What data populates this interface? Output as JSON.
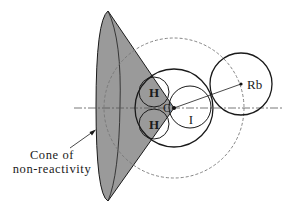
{
  "diagram": {
    "labels": {
      "h_upper": "H",
      "h_lower": "H",
      "carbon": "C",
      "iodine": "I",
      "rubidium": "Rb",
      "cone_line1": "Cone of",
      "cone_line2": "non-reactivity"
    },
    "colors": {
      "cone_fill": "#9a9a9a",
      "stroke": "#1a1a1a",
      "dashed": "#777777",
      "background": "#ffffff"
    },
    "elements": [
      {
        "id": "cone",
        "label": "Cone of non-reactivity",
        "apex": [
          174,
          108
        ]
      },
      {
        "id": "reaction-sphere",
        "style": "dashed",
        "center": [
          174,
          108
        ],
        "r": 70
      },
      {
        "id": "molecule-envelope",
        "center": [
          174,
          108
        ],
        "r": 39
      },
      {
        "id": "atom-H-upper",
        "center": [
          154,
          92
        ],
        "r": 15
      },
      {
        "id": "atom-H-lower",
        "center": [
          154,
          124
        ],
        "r": 15
      },
      {
        "id": "atom-I",
        "center": [
          190,
          107
        ],
        "r": 21
      },
      {
        "id": "atom-Rb",
        "center": [
          240,
          84
        ],
        "r": 31
      },
      {
        "id": "axis",
        "style": "dash-dot",
        "y": 108
      },
      {
        "id": "Rb-C-line",
        "from": [
          174,
          108
        ],
        "to": [
          240,
          84
        ]
      }
    ]
  }
}
